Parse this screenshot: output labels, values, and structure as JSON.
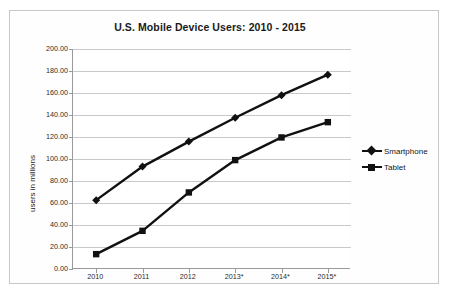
{
  "chart_data": {
    "type": "line",
    "title": "U.S. Mobile Device Users: 2010 - 2015",
    "xlabel": "",
    "ylabel": "users in millions",
    "categories": [
      "2010",
      "2011",
      "2012",
      "2013*",
      "2014*",
      "2015*"
    ],
    "series": [
      {
        "name": "Smartphone",
        "marker": "diamond",
        "color": "#111111",
        "values": [
          62.6,
          93.1,
          115.8,
          137.5,
          158.0,
          176.7
        ]
      },
      {
        "name": "Tablet",
        "marker": "square",
        "color": "#111111",
        "values": [
          13.5,
          34.7,
          69.6,
          99.0,
          119.6,
          133.5
        ]
      }
    ],
    "ylim": [
      0,
      200
    ],
    "ytick_values": [
      0,
      20,
      40,
      60,
      80,
      100,
      120,
      140,
      160,
      180,
      200
    ],
    "ytick_labels": [
      "0.00",
      "20.00",
      "40.00",
      "60.00",
      "80.00",
      "100.00",
      "120.00",
      "140.00",
      "160.00",
      "180.00",
      "200.00"
    ],
    "grid": true,
    "legend_position": "right"
  },
  "legend": {
    "entries": [
      {
        "label": "Smartphone"
      },
      {
        "label": "Tablet"
      }
    ]
  }
}
